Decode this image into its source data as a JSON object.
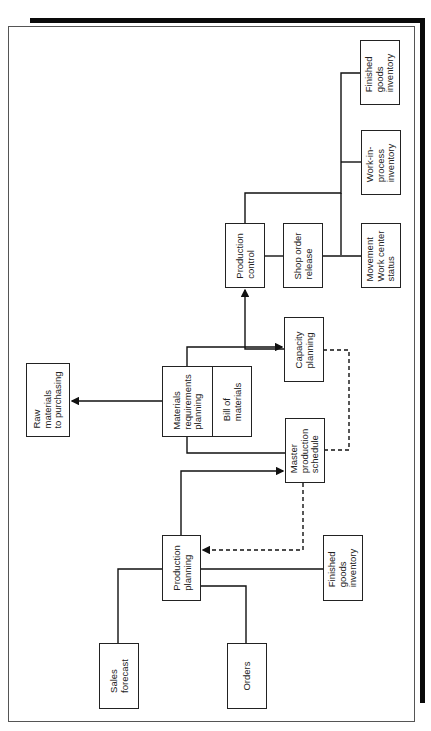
{
  "diagram": {
    "type": "flowchart",
    "orientation": "rotated-90-ccw",
    "nodes": [
      {
        "id": "sales_forecast",
        "label": "Sales\nforecast"
      },
      {
        "id": "orders",
        "label": "Orders"
      },
      {
        "id": "production_planning",
        "label": "Production\nplanning"
      },
      {
        "id": "finished_goods_bottom",
        "label": "Finished\ngoods\ninventory"
      },
      {
        "id": "master_production_schedule",
        "label": "Master\nproduction\nschedule"
      },
      {
        "id": "materials_requirements_planning",
        "label": "Materials\nrequirements\nplanning"
      },
      {
        "id": "bill_of_materials",
        "label": "Bill of\nmaterials"
      },
      {
        "id": "raw_materials",
        "label": "Raw\nmaterials\nto purchasing"
      },
      {
        "id": "capacity_planning",
        "label": "Capacity\nplanning"
      },
      {
        "id": "production_control",
        "label": "Production\ncontrol"
      },
      {
        "id": "shop_order_release",
        "label": "Shop order\nrelease"
      },
      {
        "id": "movement_status",
        "label": "Movement\nWork center\nstatus"
      },
      {
        "id": "wip_inventory",
        "label": "Work-in-\nprocess\ninventory"
      },
      {
        "id": "finished_goods_top",
        "label": "Finished\ngoods\ninventory"
      }
    ],
    "edges": [
      {
        "from": "sales_forecast",
        "to": "production_planning",
        "style": "solid"
      },
      {
        "from": "orders",
        "to": "production_planning",
        "style": "solid"
      },
      {
        "from": "finished_goods_bottom",
        "to": "production_planning",
        "style": "solid"
      },
      {
        "from": "production_planning",
        "to": "master_production_schedule",
        "style": "solid",
        "arrow": true
      },
      {
        "from": "master_production_schedule",
        "to": "production_planning",
        "style": "dashed",
        "arrow": true
      },
      {
        "from": "materials_requirements_planning",
        "to": "master_production_schedule",
        "style": "solid"
      },
      {
        "from": "materials_requirements_planning",
        "to": "capacity_planning",
        "style": "solid",
        "arrow": true
      },
      {
        "from": "materials_requirements_planning",
        "to": "raw_materials",
        "style": "solid",
        "arrow": true
      },
      {
        "from": "capacity_planning",
        "to": "master_production_schedule",
        "style": "dashed"
      },
      {
        "from": "capacity_planning",
        "to": "production_control",
        "style": "solid",
        "arrow": true
      },
      {
        "from": "production_control",
        "to": "shop_order_release",
        "style": "solid"
      },
      {
        "from": "shop_order_release",
        "to": "movement_status",
        "style": "solid"
      },
      {
        "from": "production_control",
        "to": "wip_inventory",
        "style": "solid"
      },
      {
        "from": "production_control",
        "to": "finished_goods_top",
        "style": "solid"
      }
    ]
  }
}
